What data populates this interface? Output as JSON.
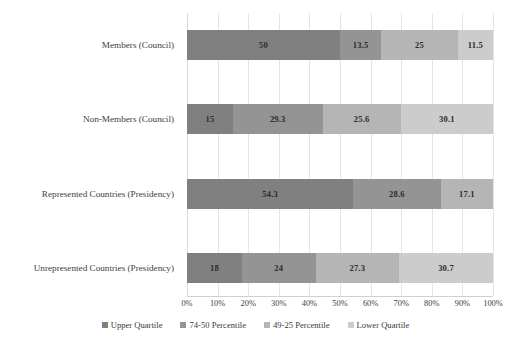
{
  "chart_data": {
    "type": "bar",
    "orientation": "horizontal",
    "stacked": true,
    "normalized_percent": true,
    "title": "",
    "subtitle": "",
    "xlabel": "",
    "ylabel": "",
    "xlim": [
      0,
      100
    ],
    "grid": true,
    "legend_position": "bottom",
    "categories": [
      "Members (Council)",
      "Non-Members (Council)",
      "Represented Countries (Presidency)",
      "Unrepresented Countries (Presidency)"
    ],
    "xticks": [
      "0%",
      "10%",
      "20%",
      "30%",
      "40%",
      "50%",
      "60%",
      "70%",
      "80%",
      "90%",
      "100%"
    ],
    "xtick_values": [
      0,
      10,
      20,
      30,
      40,
      50,
      60,
      70,
      80,
      90,
      100
    ],
    "series": [
      {
        "name": "Upper Quartile",
        "color": "#808080",
        "values": [
          50,
          15,
          54.3,
          18
        ],
        "labels": [
          "50",
          "15",
          "54.3",
          "18"
        ]
      },
      {
        "name": "74-50 Percentile",
        "color": "#949494",
        "values": [
          13.5,
          29.3,
          28.6,
          24
        ],
        "labels": [
          "13.5",
          "29.3",
          "28.6",
          "24"
        ]
      },
      {
        "name": "49-25 Percentile",
        "color": "#b5b5b5",
        "values": [
          25,
          25.6,
          17.1,
          27.3
        ],
        "labels": [
          "25",
          "25.6",
          "17.1",
          "27.3"
        ]
      },
      {
        "name": "Lower Quartile",
        "color": "#cccccc",
        "values": [
          11.5,
          30.1,
          0,
          30.7
        ],
        "labels": [
          "11.5",
          "30.1",
          "",
          "30.7"
        ]
      }
    ]
  },
  "legend": {
    "items": [
      {
        "label": "Upper Quartile",
        "color": "#808080"
      },
      {
        "label": "74-50 Percentile",
        "color": "#949494"
      },
      {
        "label": "49-25 Percentile",
        "color": "#b5b5b5"
      },
      {
        "label": "Lower Quartile",
        "color": "#cccccc"
      }
    ]
  }
}
